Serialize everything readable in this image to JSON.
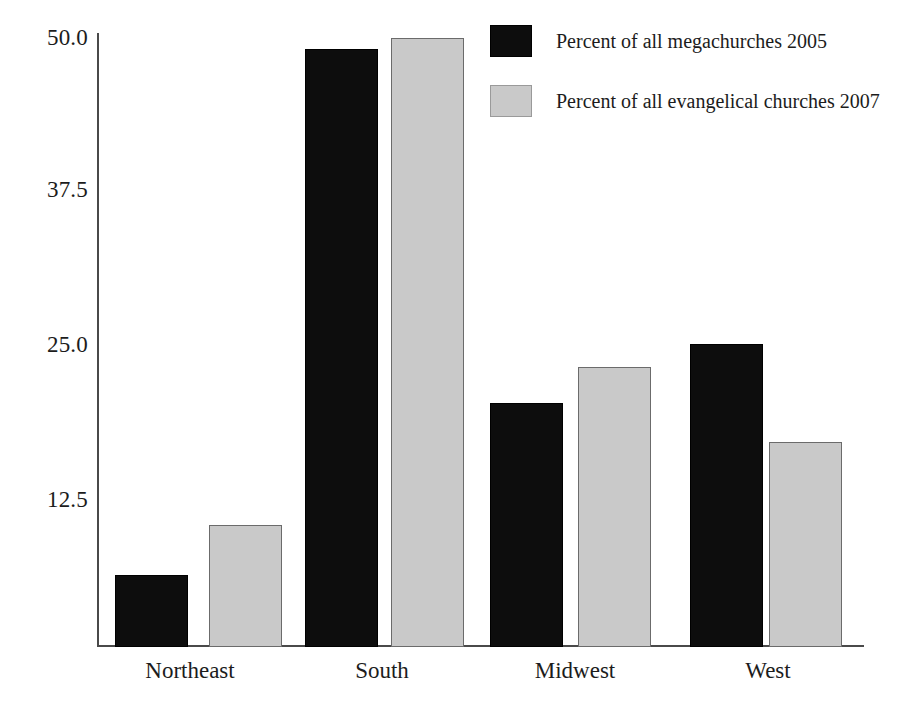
{
  "chart_data": {
    "type": "bar",
    "title": "",
    "subtitle": "",
    "xlabel": "",
    "ylabel": "",
    "categories": [
      "Northeast",
      "South",
      "Midwest",
      "West"
    ],
    "series": [
      {
        "name": "Percent of all megachurches 2005",
        "color": "#0d0d0d",
        "values": [
          6.0,
          49.5,
          20.2,
          25.1
        ]
      },
      {
        "name": "Percent of all evangelical churches 2007",
        "color": "#c9c9c9",
        "values": [
          10.1,
          50.4,
          23.2,
          17.0
        ]
      }
    ],
    "ylim": [
      0,
      50.8
    ],
    "yticks": [
      12.5,
      25.0,
      37.5,
      50.0
    ],
    "ytick_labels": [
      "12.5",
      "25.0",
      "37.5",
      "50.0"
    ],
    "grid": false,
    "legend_position": "top-right",
    "axis_color": "#4a4a4a"
  }
}
